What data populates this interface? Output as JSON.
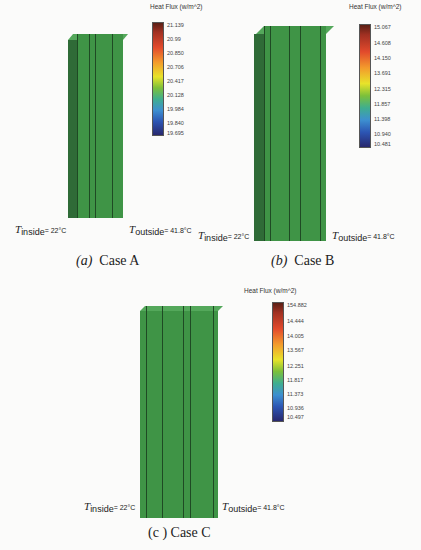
{
  "figure": {
    "panels": [
      {
        "id": "a",
        "caption_label": "(a)",
        "caption_text": "Case A",
        "legend_title": "Heat Flux (w/m^2)",
        "legend_ticks": [
          "21.139",
          "20.99",
          "20.850",
          "20.706",
          "20.417",
          "20.128",
          "19.984",
          "19.840",
          "19.695"
        ],
        "t_inside_symbol": "T",
        "t_inside_sub": "inside",
        "t_inside_value": "= 22°C",
        "t_outside_symbol": "T",
        "t_outside_sub": "outside",
        "t_outside_value": "= 41.8°C"
      },
      {
        "id": "b",
        "caption_label": "(b)",
        "caption_text": "Case B",
        "legend_title": "Heat Flux (w/m^2)",
        "legend_ticks": [
          "15.067",
          "14.608",
          "14.150",
          "13.691",
          "12.315",
          "11.857",
          "11.398",
          "10.940",
          "10.481"
        ],
        "t_inside_symbol": "T",
        "t_inside_sub": "inside",
        "t_inside_value": "= 22°C",
        "t_outside_symbol": "T",
        "t_outside_sub": "outside",
        "t_outside_value": "= 41.8°C"
      },
      {
        "id": "c",
        "caption_label": "(c )",
        "caption_text": "Case C",
        "legend_title": "Heat Flux (w/m^2)",
        "legend_ticks": [
          "154.882",
          "14.444",
          "14.005",
          "13.567",
          "12.251",
          "11.817",
          "11.373",
          "10.936",
          "10.497"
        ],
        "t_inside_symbol": "T",
        "t_inside_sub": "inside",
        "t_inside_value": "= 22°C",
        "t_outside_symbol": "T",
        "t_outside_sub": "outside",
        "t_outside_value": "= 41.8°C"
      }
    ],
    "colors": {
      "block_front": "#3f9446",
      "block_side": "#2f6b37",
      "block_top": "#4aa152",
      "edge_line": "#1f4a24"
    }
  }
}
